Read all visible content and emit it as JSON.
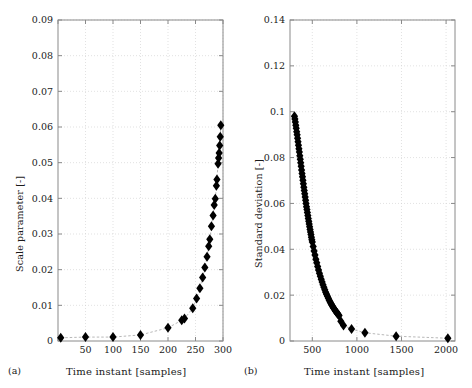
{
  "figure": {
    "background": "#ffffff",
    "marker_color": "#000000",
    "axis_color": "#8a8a8a",
    "grid_color": "#cfcfcf"
  },
  "panels": [
    {
      "tag": "(a)",
      "chart_data": {
        "type": "scatter",
        "title": "",
        "xlabel": "Time instant [samples]",
        "ylabel": "Scale parameter [-]",
        "xlim": [
          0,
          300
        ],
        "ylim": [
          0,
          0.09
        ],
        "xticks": [
          0,
          50,
          100,
          150,
          200,
          250,
          300
        ],
        "xticklabels": [
          "",
          "50",
          "100",
          "150",
          "200",
          "250",
          "300"
        ],
        "yticks": [
          0,
          0.01,
          0.02,
          0.03,
          0.04,
          0.05,
          0.06,
          0.07,
          0.08,
          0.09
        ],
        "yticklabels": [
          "0",
          "0.01",
          "0.02",
          "0.03",
          "0.04",
          "0.05",
          "0.06",
          "0.07",
          "0.08",
          "0.09"
        ],
        "grid": true,
        "legend": "none",
        "marker": "diamond",
        "connect_line": "dashed",
        "points": [
          {
            "x": 5,
            "y": 0.0009
          },
          {
            "x": 50,
            "y": 0.0011
          },
          {
            "x": 100,
            "y": 0.0011
          },
          {
            "x": 150,
            "y": 0.0017
          },
          {
            "x": 200,
            "y": 0.0037
          },
          {
            "x": 225,
            "y": 0.0058
          },
          {
            "x": 230,
            "y": 0.0063
          },
          {
            "x": 245,
            "y": 0.0092
          },
          {
            "x": 252,
            "y": 0.0119
          },
          {
            "x": 258,
            "y": 0.0148
          },
          {
            "x": 263,
            "y": 0.0178
          },
          {
            "x": 267,
            "y": 0.0206
          },
          {
            "x": 271,
            "y": 0.0236
          },
          {
            "x": 274,
            "y": 0.0266
          },
          {
            "x": 276,
            "y": 0.0285
          },
          {
            "x": 279,
            "y": 0.0322
          },
          {
            "x": 282,
            "y": 0.0352
          },
          {
            "x": 284,
            "y": 0.0381
          },
          {
            "x": 286,
            "y": 0.0399
          },
          {
            "x": 288,
            "y": 0.0435
          },
          {
            "x": 289,
            "y": 0.0453
          },
          {
            "x": 291,
            "y": 0.0497
          },
          {
            "x": 292,
            "y": 0.0513
          },
          {
            "x": 293,
            "y": 0.0527
          },
          {
            "x": 294,
            "y": 0.0548
          },
          {
            "x": 295,
            "y": 0.0573
          },
          {
            "x": 296,
            "y": 0.0605
          }
        ]
      }
    },
    {
      "tag": "(b)",
      "chart_data": {
        "type": "scatter",
        "title": "",
        "xlabel": "Time instant [samples]",
        "ylabel": "Standard deviation [-]",
        "xlim": [
          250,
          2100
        ],
        "ylim": [
          0,
          0.14
        ],
        "xticks": [
          500,
          1000,
          1500,
          2000
        ],
        "xticklabels": [
          "500",
          "1000",
          "1500",
          "2000"
        ],
        "yticks": [
          0,
          0.02,
          0.04,
          0.06,
          0.08,
          0.1,
          0.12,
          0.14
        ],
        "yticklabels": [
          "0",
          "0.02",
          "0.04",
          "0.06",
          "0.08",
          "0.1",
          "0.12",
          "0.14"
        ],
        "grid": true,
        "legend": "none",
        "marker": "diamond",
        "connect_line": "dashed",
        "points": [
          {
            "x": 300,
            "y": 0.098
          },
          {
            "x": 305,
            "y": 0.0968
          },
          {
            "x": 310,
            "y": 0.0955
          },
          {
            "x": 315,
            "y": 0.0941
          },
          {
            "x": 320,
            "y": 0.0928
          },
          {
            "x": 325,
            "y": 0.0913
          },
          {
            "x": 330,
            "y": 0.0899
          },
          {
            "x": 335,
            "y": 0.0884
          },
          {
            "x": 340,
            "y": 0.0869
          },
          {
            "x": 345,
            "y": 0.0854
          },
          {
            "x": 350,
            "y": 0.0839
          },
          {
            "x": 355,
            "y": 0.0824
          },
          {
            "x": 360,
            "y": 0.0808
          },
          {
            "x": 365,
            "y": 0.0793
          },
          {
            "x": 370,
            "y": 0.0777
          },
          {
            "x": 375,
            "y": 0.0762
          },
          {
            "x": 380,
            "y": 0.0746
          },
          {
            "x": 385,
            "y": 0.0731
          },
          {
            "x": 390,
            "y": 0.0716
          },
          {
            "x": 395,
            "y": 0.0701
          },
          {
            "x": 400,
            "y": 0.0686
          },
          {
            "x": 405,
            "y": 0.0671
          },
          {
            "x": 410,
            "y": 0.0656
          },
          {
            "x": 415,
            "y": 0.0642
          },
          {
            "x": 420,
            "y": 0.0628
          },
          {
            "x": 425,
            "y": 0.0614
          },
          {
            "x": 430,
            "y": 0.06
          },
          {
            "x": 435,
            "y": 0.0586
          },
          {
            "x": 440,
            "y": 0.0573
          },
          {
            "x": 445,
            "y": 0.056
          },
          {
            "x": 450,
            "y": 0.0547
          },
          {
            "x": 455,
            "y": 0.0534
          },
          {
            "x": 460,
            "y": 0.0522
          },
          {
            "x": 465,
            "y": 0.051
          },
          {
            "x": 470,
            "y": 0.0498
          },
          {
            "x": 475,
            "y": 0.0486
          },
          {
            "x": 480,
            "y": 0.0475
          },
          {
            "x": 485,
            "y": 0.0464
          },
          {
            "x": 490,
            "y": 0.0453
          },
          {
            "x": 495,
            "y": 0.0442
          },
          {
            "x": 500,
            "y": 0.0432
          },
          {
            "x": 510,
            "y": 0.0412
          },
          {
            "x": 520,
            "y": 0.0393
          },
          {
            "x": 530,
            "y": 0.0375
          },
          {
            "x": 540,
            "y": 0.0357
          },
          {
            "x": 550,
            "y": 0.0341
          },
          {
            "x": 560,
            "y": 0.0325
          },
          {
            "x": 570,
            "y": 0.031
          },
          {
            "x": 580,
            "y": 0.0296
          },
          {
            "x": 590,
            "y": 0.0282
          },
          {
            "x": 600,
            "y": 0.0269
          },
          {
            "x": 610,
            "y": 0.0257
          },
          {
            "x": 620,
            "y": 0.0245
          },
          {
            "x": 630,
            "y": 0.0234
          },
          {
            "x": 640,
            "y": 0.0223
          },
          {
            "x": 650,
            "y": 0.0213
          },
          {
            "x": 660,
            "y": 0.0204
          },
          {
            "x": 670,
            "y": 0.0195
          },
          {
            "x": 680,
            "y": 0.0186
          },
          {
            "x": 690,
            "y": 0.0178
          },
          {
            "x": 700,
            "y": 0.017
          },
          {
            "x": 710,
            "y": 0.0163
          },
          {
            "x": 720,
            "y": 0.0156
          },
          {
            "x": 730,
            "y": 0.0149
          },
          {
            "x": 740,
            "y": 0.0143
          },
          {
            "x": 750,
            "y": 0.0137
          },
          {
            "x": 760,
            "y": 0.0131
          },
          {
            "x": 770,
            "y": 0.0126
          },
          {
            "x": 780,
            "y": 0.0121
          },
          {
            "x": 790,
            "y": 0.0116
          },
          {
            "x": 800,
            "y": 0.0111
          },
          {
            "x": 820,
            "y": 0.0086
          },
          {
            "x": 850,
            "y": 0.0068
          },
          {
            "x": 940,
            "y": 0.0052
          },
          {
            "x": 1090,
            "y": 0.0036
          },
          {
            "x": 1440,
            "y": 0.0021
          },
          {
            "x": 2020,
            "y": 0.0012
          }
        ]
      }
    }
  ]
}
